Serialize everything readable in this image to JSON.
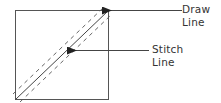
{
  "diagram": {
    "type": "quilting half-square triangle marking",
    "colors": {
      "stroke": "#333333",
      "background": "#ffffff",
      "text": "#333333"
    },
    "square": {
      "x": 15,
      "y": 10,
      "width": 93,
      "height": 89
    },
    "lines": {
      "draw_line": {
        "style": "solid",
        "from": [
          15,
          99
        ],
        "to": [
          108,
          10
        ]
      },
      "stitch_lines": [
        {
          "style": "dashed",
          "offset": -4
        },
        {
          "style": "dashed",
          "offset": 4
        }
      ]
    },
    "labels": {
      "draw": {
        "line1": "Draw",
        "line2": "Line"
      },
      "stitch": {
        "line1": "Stitch",
        "line2": "Line"
      }
    },
    "arrows": {
      "draw": {
        "from": [
          182,
          10
        ],
        "to": [
          110,
          10
        ],
        "icon": "arrow-left-icon"
      },
      "stitch": {
        "from": [
          149,
          50
        ],
        "to": [
          75,
          50
        ],
        "icon": "arrow-left-icon"
      }
    }
  }
}
